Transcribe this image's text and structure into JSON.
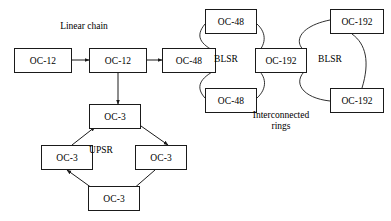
{
  "diagram": {
    "title_labels": [
      {
        "name": "linear-chain-label",
        "text": "Linear chain",
        "x": 48,
        "y": 21,
        "w": 72
      },
      {
        "name": "upsr-label",
        "text": "UPSR",
        "x": 84,
        "y": 145,
        "w": 34
      },
      {
        "name": "blsr-left-label",
        "text": "BLSR",
        "x": 209,
        "y": 54,
        "w": 34
      },
      {
        "name": "blsr-right-label",
        "text": "BLSR",
        "x": 313,
        "y": 54,
        "w": 34
      },
      {
        "name": "interconnected-rings-label",
        "text": "Interconnected rings",
        "x": 248,
        "y": 110,
        "w": 66
      }
    ],
    "nodes": [
      {
        "name": "node-oc12-left",
        "label": "OC-12",
        "x": 14,
        "y": 48,
        "w": 58,
        "h": 25
      },
      {
        "name": "node-oc12-center",
        "label": "OC-12",
        "x": 89,
        "y": 48,
        "w": 58,
        "h": 25
      },
      {
        "name": "node-oc48-west",
        "label": "OC-48",
        "x": 162,
        "y": 48,
        "w": 54,
        "h": 25
      },
      {
        "name": "node-oc48-north",
        "label": "OC-48",
        "x": 205,
        "y": 9,
        "w": 52,
        "h": 25
      },
      {
        "name": "node-oc48-south",
        "label": "OC-48",
        "x": 205,
        "y": 88,
        "w": 52,
        "h": 25
      },
      {
        "name": "node-oc192-center",
        "label": "OC-192",
        "x": 255,
        "y": 48,
        "w": 52,
        "h": 25
      },
      {
        "name": "node-oc192-north",
        "label": "OC-192",
        "x": 330,
        "y": 9,
        "w": 54,
        "h": 25
      },
      {
        "name": "node-oc192-south",
        "label": "OC-192",
        "x": 330,
        "y": 88,
        "w": 54,
        "h": 25
      },
      {
        "name": "node-oc3-top",
        "label": "OC-3",
        "x": 89,
        "y": 104,
        "w": 52,
        "h": 25
      },
      {
        "name": "node-oc3-left",
        "label": "OC-3",
        "x": 41,
        "y": 145,
        "w": 52,
        "h": 25
      },
      {
        "name": "node-oc3-right",
        "label": "OC-3",
        "x": 135,
        "y": 145,
        "w": 52,
        "h": 25
      },
      {
        "name": "node-oc3-bottom",
        "label": "OC-3",
        "x": 88,
        "y": 186,
        "w": 52,
        "h": 25
      }
    ],
    "connections": [
      {
        "name": "link-oc12-left-to-oc12-center",
        "kind": "double-arrow",
        "x1": 72,
        "y1": 60,
        "x2": 89,
        "y2": 60
      },
      {
        "name": "link-oc12-center-to-oc48",
        "kind": "double-arrow",
        "x1": 147,
        "y1": 60,
        "x2": 162,
        "y2": 60
      },
      {
        "name": "link-oc12-center-to-oc3-top",
        "kind": "double-arrow",
        "x1": 118,
        "y1": 73,
        "x2": 118,
        "y2": 104
      },
      {
        "name": "link-oc3-top-to-oc3-right",
        "kind": "single-arrow",
        "x1": 141,
        "y1": 126,
        "x2": 168,
        "y2": 145
      },
      {
        "name": "link-oc3-right-to-oc3-bottom",
        "kind": "single-arrow",
        "x1": 155,
        "y1": 170,
        "x2": 132,
        "y2": 190
      },
      {
        "name": "link-oc3-bottom-to-oc3-left",
        "kind": "single-arrow",
        "x1": 92,
        "y1": 188,
        "x2": 67,
        "y2": 170
      },
      {
        "name": "link-oc3-left-to-oc3-top",
        "kind": "single-arrow",
        "x1": 72,
        "y1": 145,
        "x2": 95,
        "y2": 127
      }
    ],
    "ring_arcs": [
      {
        "name": "arc-blsr-left-nw",
        "d": "M 216,52 C 200,44 195,36 205,24"
      },
      {
        "name": "arc-blsr-left-ne",
        "d": "M 257,24 C 268,34 265,46 257,53"
      },
      {
        "name": "arc-blsr-left-se",
        "d": "M 257,69 C 266,76 268,88 257,98"
      },
      {
        "name": "arc-blsr-left-sw",
        "d": "M 205,98 C 195,87 200,78 216,70"
      },
      {
        "name": "arc-blsr-right-nw",
        "d": "M 306,52 C 292,42 300,26 330,20"
      },
      {
        "name": "arc-blsr-right-ne",
        "d": "M 352,34 C 366,44 370,62 362,88"
      },
      {
        "name": "arc-blsr-right-sw",
        "d": "M 306,70 C 292,82 302,98 330,101"
      }
    ],
    "style": {
      "stroke_color": "#1a1a1a",
      "box_fill": "#ffffff",
      "page_background": "#ffffff"
    }
  }
}
